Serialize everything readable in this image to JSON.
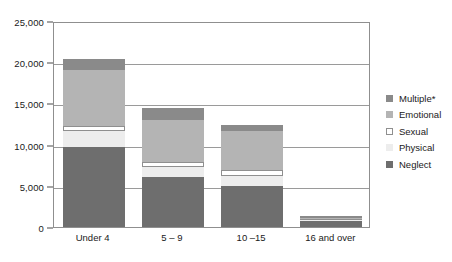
{
  "chart_data": {
    "type": "bar",
    "stacked": true,
    "title": "",
    "xlabel": "",
    "ylabel": "",
    "categories": [
      "Under 4",
      "5 – 9",
      "10 –15",
      "16 and over"
    ],
    "ylim": [
      0,
      25000
    ],
    "yticks": [
      0,
      5000,
      10000,
      15000,
      20000,
      25000
    ],
    "ytick_labels": [
      "0",
      "5,000",
      "10,000",
      "15,000",
      "20,000",
      "25,000"
    ],
    "grid": true,
    "legend_position": "right",
    "series": [
      {
        "name": "Neglect",
        "color": "#6e6e6e",
        "border": "#6e6e6e",
        "values": [
          9700,
          6100,
          5000,
          700
        ]
      },
      {
        "name": "Physical",
        "color": "#ededed",
        "border": "#ededed",
        "values": [
          1900,
          1150,
          1200,
          150
        ]
      },
      {
        "name": "Sexual",
        "color": "#ffffff",
        "border": "#8f8f8f",
        "values": [
          700,
          700,
          700,
          120
        ]
      },
      {
        "name": "Emotional",
        "color": "#b4b4b4",
        "border": "#b4b4b4",
        "values": [
          6700,
          5000,
          4700,
          180
        ]
      },
      {
        "name": "Multiple*",
        "color": "#8a8a8a",
        "border": "#8a8a8a",
        "values": [
          1450,
          1450,
          800,
          150
        ]
      }
    ],
    "stack_order_bottom_to_top": [
      "Neglect",
      "Physical",
      "Sexual",
      "Emotional",
      "Multiple*"
    ],
    "legend_order_top_to_bottom": [
      "Multiple*",
      "Emotional",
      "Sexual",
      "Physical",
      "Neglect"
    ],
    "totals": [
      20450,
      14400,
      12400,
      1300
    ]
  }
}
